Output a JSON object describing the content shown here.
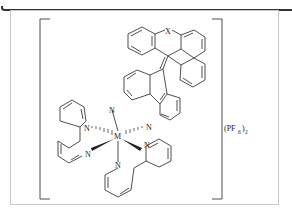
{
  "figure": {
    "type": "chemical-structure",
    "atoms": {
      "metal": "M",
      "nitrogen": "N",
      "heteroatom": "X"
    },
    "counterion": {
      "label": "(PF",
      "subscript_inner": "6",
      "close": ")",
      "subscript_outer": "2"
    },
    "colors": {
      "line": "#222222",
      "frame": "#c8c8c8",
      "topbar": "#333333"
    }
  }
}
